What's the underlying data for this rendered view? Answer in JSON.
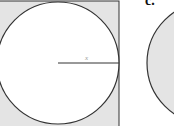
{
  "figure": {
    "panel_label": "c.",
    "radius_label": "x",
    "left_shape": {
      "description": "circle inscribed in a square",
      "square_fill": "#e4e4e4",
      "circle_fill": "#ffffff",
      "stroke": "#333333"
    },
    "right_shape": {
      "description": "filled circle",
      "circle_fill": "#e4e4e4",
      "stroke": "#333333"
    }
  }
}
